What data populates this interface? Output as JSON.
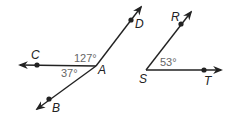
{
  "figure_left": {
    "vertex": "A",
    "points": {
      "C": "C",
      "D": "D",
      "B": "B"
    },
    "angles": {
      "CAD": "127°",
      "CAB": "37°"
    }
  },
  "figure_right": {
    "vertex": "S",
    "points": {
      "R": "R",
      "T": "T"
    },
    "angles": {
      "RST": "53°"
    }
  },
  "colors": {
    "line": "#222222",
    "angle_text": "#666666"
  }
}
